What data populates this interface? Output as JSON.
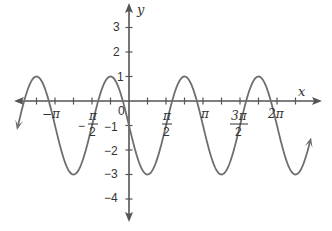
{
  "chart_data": {
    "type": "line",
    "title": "",
    "function": "y = -1 - 2 sin(3x)",
    "xlabel": "x",
    "ylabel": "y",
    "xlim": [
      -3.85,
      5.2
    ],
    "ylim": [
      -4.8,
      4.0
    ],
    "grid": false,
    "legend": null,
    "x_tick_labels": [
      "−π",
      "−π/2",
      "π/2",
      "π",
      "3π/2",
      "2π"
    ],
    "x_tick_values": [
      -3.14159,
      -1.5708,
      1.5708,
      3.14159,
      4.71239,
      6.28318
    ],
    "x_minor_tick_step": "π/6",
    "y_tick_labels": [
      "3",
      "2",
      "1",
      "−1",
      "−2",
      "−3",
      "−4"
    ],
    "y_tick_values": [
      3,
      2,
      1,
      -1,
      -2,
      -3,
      -4
    ],
    "origin_label": "0",
    "max_value": 1,
    "min_value": -3,
    "period": "2π/3",
    "series": [
      {
        "name": "curve",
        "x_start": -3.14,
        "x_end": 5.12,
        "arrows": "both-ends"
      }
    ]
  },
  "labels": {
    "x_axis": "x",
    "y_axis": "y",
    "origin": "0",
    "neg_pi": "−π",
    "pi": "π",
    "two_pi": "2π",
    "y3": "3",
    "y2": "2",
    "y1": "1",
    "ym1": "−1",
    "ym2": "−2",
    "ym3": "−3",
    "ym4": "−4",
    "half_num_pi": "π",
    "half_den": "2",
    "three_pi_num": "3π",
    "minus_sign": "−"
  },
  "colors": {
    "axis": "#555555",
    "curve": "#6e6e6e",
    "text": "#333333"
  }
}
